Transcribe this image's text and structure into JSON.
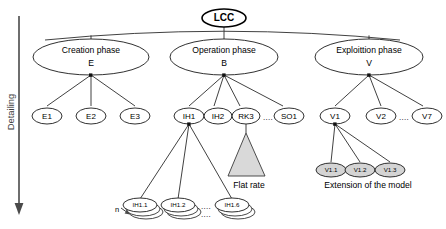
{
  "diagram": {
    "type": "tree-hierarchy",
    "title_node": "LCC",
    "axis": {
      "label": "Detailing",
      "direction": "downward-arrow"
    },
    "root": {
      "label": "LCC",
      "name": "root-node-lcc"
    },
    "phases": [
      {
        "label_line1": "Creation phase",
        "label_line2": "E",
        "name": "phase-node-creation"
      },
      {
        "label_line1": "Operation phase",
        "label_line2": "B",
        "name": "phase-node-operation"
      },
      {
        "label_line1": "Exploittion phase",
        "label_line2": "V",
        "name": "phase-node-exploitation"
      }
    ],
    "creation_children": [
      {
        "label": "E1"
      },
      {
        "label": "E2"
      },
      {
        "label": "E3"
      }
    ],
    "operation_children": [
      {
        "label": "IH1"
      },
      {
        "label": "IH2"
      },
      {
        "label": "RK3"
      },
      {
        "label": "SO1"
      }
    ],
    "operation_ellipsis": "....",
    "exploitation_children": [
      {
        "label": "V1"
      },
      {
        "label": "V2"
      },
      {
        "label": "V7"
      }
    ],
    "exploitation_ellipsis": "....",
    "ih1_children": [
      {
        "label": "IH1.1"
      },
      {
        "label": "IH1.2"
      },
      {
        "label": "IH1.6"
      }
    ],
    "ih1_ellipsis_top": "....",
    "ih1_ellipsis_bottom": "....",
    "ih1_multiplicity": "n",
    "v1_children": [
      {
        "label": "V1.1"
      },
      {
        "label": "V1.2"
      },
      {
        "label": "V1.3"
      }
    ],
    "annotations": {
      "flat_rate": "Flat rate",
      "extension": "Extension of the model"
    },
    "colors": {
      "line": "#2b2b2b",
      "node_fill": "#ffffff",
      "shaded_fill": "#d4d4d4",
      "triangle_fill": "#d9d9d9",
      "text": "#000000",
      "axis": "#4a4a4a"
    }
  }
}
